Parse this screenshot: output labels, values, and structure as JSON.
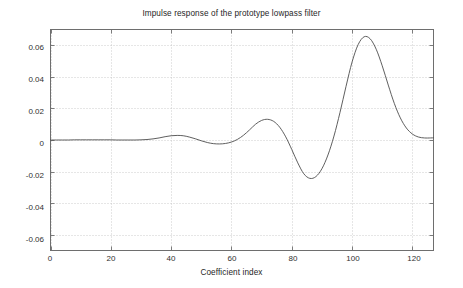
{
  "chart_data": {
    "type": "line",
    "title": "Impulse response of the prototype lowpass filter",
    "xlabel": "Coefficient index",
    "ylabel": "",
    "xlim": [
      0,
      127
    ],
    "ylim": [
      -0.07,
      0.07
    ],
    "xticks": [
      0,
      20,
      40,
      60,
      80,
      100,
      120
    ],
    "xtick_labels": [
      "0",
      "20",
      "40",
      "60",
      "80",
      "100",
      "120"
    ],
    "yticks": [
      0.06,
      0.04,
      0.02,
      0,
      -0.02,
      -0.04,
      -0.06
    ],
    "ytick_labels": [
      "0.06",
      "0.04",
      "0.02",
      "0",
      "-0.02",
      "-0.04",
      "-0.06"
    ],
    "grid": true,
    "grid_style": "dotted",
    "line_color": "#4d4d4d",
    "series": [
      {
        "name": "impulse response",
        "x": [
          0,
          2,
          4,
          6,
          8,
          10,
          12,
          14,
          16,
          18,
          20,
          22,
          24,
          26,
          28,
          30,
          32,
          34,
          36,
          38,
          40,
          42,
          44,
          46,
          48,
          50,
          52,
          54,
          56,
          58,
          60,
          62,
          64,
          66,
          68,
          70,
          72,
          74,
          76,
          78,
          80,
          82,
          84,
          86,
          88,
          90,
          92,
          94,
          96,
          98,
          100,
          102,
          104,
          106,
          108,
          110,
          112,
          114,
          116,
          118,
          120,
          122,
          124,
          126,
          127
        ],
        "values": [
          0.0,
          0.0,
          0.0,
          0.0,
          0.0001,
          0.0001,
          0.0001,
          0.0001,
          0.0001,
          0.0001,
          0.0001,
          0.0,
          0.0,
          0.0,
          0.0,
          0.0001,
          0.0003,
          0.0007,
          0.0013,
          0.0021,
          0.0027,
          0.0029,
          0.0027,
          0.0019,
          0.0008,
          -0.0005,
          -0.0016,
          -0.0023,
          -0.0025,
          -0.0022,
          -0.0013,
          0.0004,
          0.003,
          0.0064,
          0.01,
          0.0124,
          0.0131,
          0.0118,
          0.0081,
          0.002,
          -0.006,
          -0.0145,
          -0.0214,
          -0.0243,
          -0.0232,
          -0.0182,
          -0.0095,
          0.0025,
          0.0175,
          0.034,
          0.0494,
          0.0604,
          0.0654,
          0.0641,
          0.0575,
          0.047,
          0.0348,
          0.0232,
          0.014,
          0.0076,
          0.0038,
          0.0019,
          0.0013,
          0.0013,
          0.0014
        ]
      }
    ]
  }
}
